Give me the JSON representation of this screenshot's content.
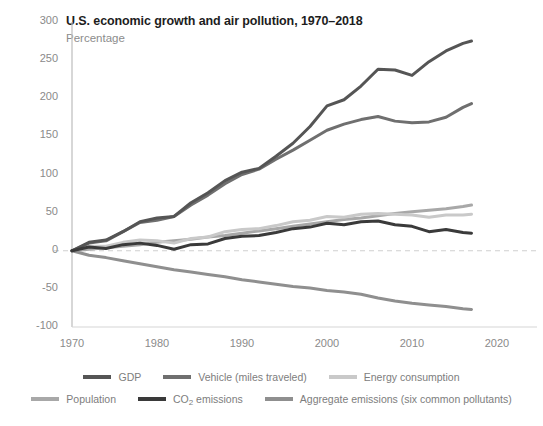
{
  "chart_data": {
    "type": "line",
    "title": "U.S. economic growth and air pollution, 1970–2018",
    "subtitle": "Percentage",
    "xlabel": "",
    "ylabel": "",
    "xlim": [
      1970,
      2020
    ],
    "ylim": [
      -100,
      300
    ],
    "grid": false,
    "zero_line": true,
    "legend_position": "bottom",
    "xticks": [
      "1970",
      "1980",
      "1990",
      "2000",
      "2010",
      "2020"
    ],
    "xtick_values": [
      1970,
      1980,
      1990,
      2000,
      2010,
      2020
    ],
    "yticks": [
      "300",
      "250",
      "200",
      "150",
      "100",
      "50",
      "0",
      "-50",
      "-100"
    ],
    "ytick_values": [
      300,
      250,
      200,
      150,
      100,
      50,
      0,
      -50,
      -100
    ],
    "x": [
      1970,
      1972,
      1974,
      1976,
      1978,
      1980,
      1982,
      1984,
      1986,
      1988,
      1990,
      1992,
      1994,
      1996,
      1998,
      2000,
      2002,
      2004,
      2006,
      2008,
      2010,
      2012,
      2014,
      2016,
      2017
    ],
    "series": [
      {
        "name": "GDP",
        "color": "#555555",
        "values": [
          0,
          11,
          14,
          25,
          38,
          43,
          45,
          63,
          76,
          92,
          103,
          108,
          124,
          141,
          163,
          190,
          198,
          216,
          238,
          237,
          230,
          248,
          262,
          272,
          275
        ]
      },
      {
        "name": "Vehicle (miles traveled)",
        "color": "#6f6f6f",
        "values": [
          0,
          10,
          13,
          25,
          37,
          40,
          45,
          60,
          73,
          88,
          100,
          107,
          120,
          132,
          145,
          158,
          166,
          172,
          176,
          170,
          168,
          169,
          175,
          188,
          193
        ]
      },
      {
        "name": "Energy consumption",
        "color": "#c9c9c9",
        "values": [
          0,
          6,
          6,
          11,
          14,
          13,
          10,
          16,
          18,
          25,
          28,
          29,
          33,
          38,
          40,
          45,
          44,
          48,
          49,
          48,
          47,
          44,
          47,
          47,
          48
        ]
      },
      {
        "name": "Population",
        "color": "#a8a8a8",
        "values": [
          0,
          2,
          4,
          6,
          8,
          11,
          13,
          15,
          18,
          20,
          23,
          26,
          29,
          32,
          35,
          38,
          41,
          43,
          46,
          49,
          51,
          53,
          55,
          58,
          60
        ]
      },
      {
        "name": "CO2 emissions",
        "color": "#3a3a3a",
        "values": [
          0,
          5,
          3,
          8,
          10,
          7,
          2,
          8,
          9,
          16,
          19,
          20,
          24,
          29,
          31,
          36,
          34,
          38,
          39,
          34,
          32,
          25,
          28,
          24,
          23
        ]
      },
      {
        "name": "Aggregate emissions (six common pollutants)",
        "color": "#8f8f8f",
        "values": [
          0,
          -6,
          -9,
          -13,
          -17,
          -21,
          -25,
          -28,
          -31,
          -34,
          -38,
          -41,
          -44,
          -47,
          -49,
          -52,
          -54,
          -57,
          -62,
          -66,
          -69,
          -71,
          -73,
          -76,
          -77
        ]
      }
    ],
    "legend": [
      {
        "label": "GDP",
        "color": "#555555"
      },
      {
        "label": "Vehicle (miles traveled)",
        "color": "#6f6f6f"
      },
      {
        "label": "Energy consumption",
        "color": "#c9c9c9"
      },
      {
        "label": "Population",
        "color": "#a8a8a8"
      },
      {
        "label": "CO₂ emissions",
        "color": "#3a3a3a"
      },
      {
        "label": "Aggregate emissions (six common pollutants)",
        "color": "#8f8f8f"
      }
    ]
  }
}
